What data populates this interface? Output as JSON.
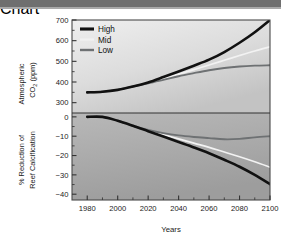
{
  "figure": {
    "background_color": "#ffffff",
    "top_bar_color": "#6f6f6f",
    "plot_bg_light": "#eceded",
    "plot_bg_dark": "#9b9b9b",
    "frame_color": "#4a4a4a"
  },
  "chart_data": {
    "type": "line",
    "title": "",
    "xlabel": "Years",
    "x": [
      1980,
      1990,
      2000,
      2010,
      2020,
      2030,
      2040,
      2050,
      2060,
      2070,
      2080,
      2090,
      2100
    ],
    "xlim": [
      1970,
      2100
    ],
    "xticks": [
      1980,
      2000,
      2020,
      2040,
      2060,
      2080,
      2100
    ],
    "xticklabels": [
      "1980",
      "2000",
      "2020",
      "2040",
      "2060",
      "2080",
      "2100"
    ],
    "grid": false,
    "legend_position": "top-left",
    "legend": [
      "High",
      "Mid",
      "Low"
    ],
    "colors": {
      "High": "#111111",
      "Mid": "#f2f2f2",
      "Low": "#6e7173"
    },
    "panels": [
      {
        "id": "co2",
        "ylabel": "Atmospheric CO₂ (ppm)",
        "ylabel_line1": "Atmospheric",
        "ylabel_line2": "CO",
        "ylabel_sub": "2",
        "ylabel_line2b": " (ppm)",
        "ylim": [
          250,
          700
        ],
        "yticks": [
          300,
          400,
          500,
          600,
          700
        ],
        "yticklabels": [
          "300",
          "400",
          "500",
          "600",
          "700"
        ],
        "minor_tick_step": 50,
        "series": [
          {
            "name": "High",
            "values": [
              350,
              353,
              362,
              378,
              398,
              424,
              451,
              479,
              508,
              545,
              590,
              641,
              700
            ]
          },
          {
            "name": "Mid",
            "values": [
              350,
              353,
              362,
              378,
              396,
              417,
              438,
              460,
              482,
              505,
              528,
              550,
              570
            ]
          },
          {
            "name": "Low",
            "values": [
              350,
              353,
              362,
              378,
              394,
              410,
              428,
              443,
              457,
              468,
              475,
              479,
              481
            ]
          }
        ]
      },
      {
        "id": "calcification",
        "ylabel": "% Reduction of Reef Calcification",
        "ylabel_line1": "% Reduction of",
        "ylabel_line2": "Reef Calcification",
        "ylim": [
          -43,
          2
        ],
        "yticks": [
          0,
          -10,
          -20,
          -30,
          -40
        ],
        "yticklabels": [
          "0",
          "−10",
          "−20",
          "−30",
          "−40"
        ],
        "minor_tick_step": 5,
        "series": [
          {
            "name": "High",
            "values": [
              0,
              0,
              -2.0,
              -4.6,
              -7.4,
              -10.2,
              -13.0,
              -15.8,
              -18.8,
              -22.2,
              -25.8,
              -30.0,
              -34.8
            ]
          },
          {
            "name": "Mid",
            "values": [
              0,
              0,
              -2.0,
              -4.6,
              -7.0,
              -9.2,
              -11.4,
              -13.6,
              -15.8,
              -18.2,
              -20.6,
              -23.2,
              -26.0
            ]
          },
          {
            "name": "Low",
            "values": [
              0,
              0,
              -2.0,
              -4.6,
              -6.8,
              -8.4,
              -9.6,
              -10.4,
              -11.0,
              -11.6,
              -11.4,
              -10.6,
              -10.0
            ]
          }
        ]
      }
    ]
  }
}
